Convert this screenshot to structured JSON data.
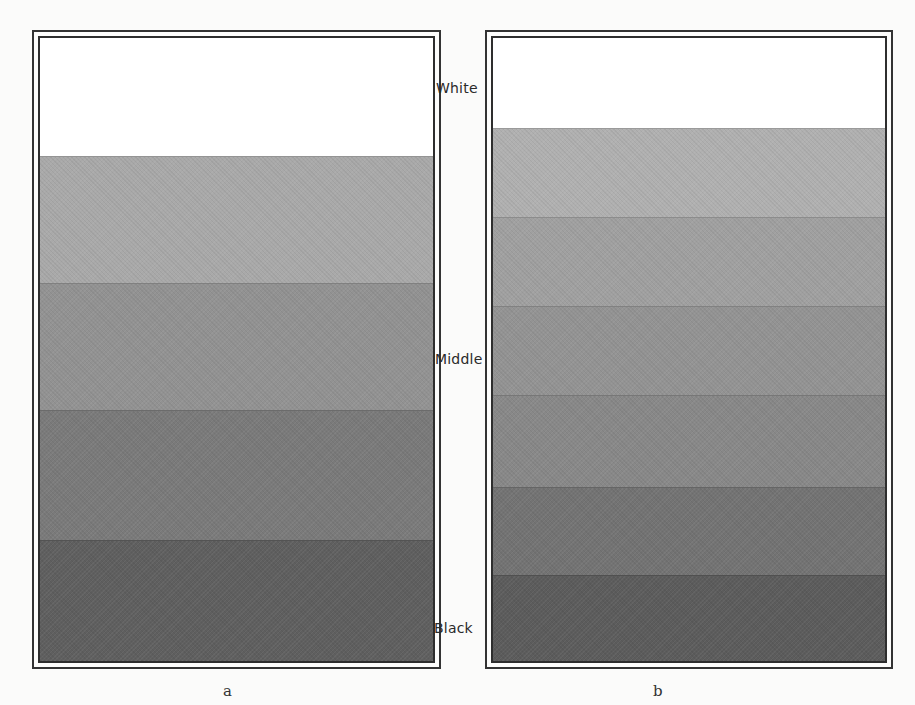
{
  "figure": {
    "scale_labels": {
      "white": "White",
      "middle": "Middle",
      "black": "Black"
    },
    "panels": [
      {
        "caption": "a",
        "band_count": 5,
        "bands": [
          {
            "tone": "white",
            "color": "#ffffff"
          },
          {
            "tone": "light-gray",
            "color": "#a9a9a9"
          },
          {
            "tone": "middle-gray",
            "color": "#929292"
          },
          {
            "tone": "dark-gray",
            "color": "#7a7a7a"
          },
          {
            "tone": "black",
            "color": "#5f5f5f"
          }
        ]
      },
      {
        "caption": "b",
        "band_count": 7,
        "bands": [
          {
            "tone": "white",
            "color": "#ffffff"
          },
          {
            "tone": "gray-1",
            "color": "#b0b0b0"
          },
          {
            "tone": "gray-2",
            "color": "#a0a0a0"
          },
          {
            "tone": "gray-3",
            "color": "#939393"
          },
          {
            "tone": "gray-4",
            "color": "#888888"
          },
          {
            "tone": "gray-5",
            "color": "#737373"
          },
          {
            "tone": "gray-6",
            "color": "#5c5c5c"
          }
        ]
      }
    ]
  }
}
